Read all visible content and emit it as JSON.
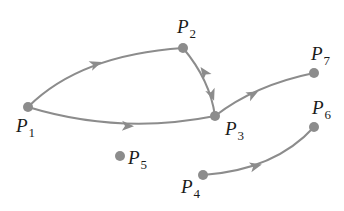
{
  "diagram": {
    "colors": {
      "edge": "#8c8c8c",
      "node": "#8c8c8c",
      "label": "#1a1a1a",
      "background": "#ffffff"
    },
    "nodes": [
      {
        "id": "P1",
        "letter": "P",
        "sub": "1",
        "x": 28,
        "y": 107,
        "lx": 16,
        "ly": 132
      },
      {
        "id": "P2",
        "letter": "P",
        "sub": "2",
        "x": 183,
        "y": 48,
        "lx": 177,
        "ly": 33
      },
      {
        "id": "P3",
        "letter": "P",
        "sub": "3",
        "x": 215,
        "y": 116,
        "lx": 225,
        "ly": 135
      },
      {
        "id": "P4",
        "letter": "P",
        "sub": "4",
        "x": 203,
        "y": 175,
        "lx": 181,
        "ly": 193
      },
      {
        "id": "P5",
        "letter": "P",
        "sub": "5",
        "x": 120,
        "y": 156,
        "lx": 128,
        "ly": 164
      },
      {
        "id": "P6",
        "letter": "P",
        "sub": "6",
        "x": 314,
        "y": 127,
        "lx": 312,
        "ly": 114
      },
      {
        "id": "P7",
        "letter": "P",
        "sub": "7",
        "x": 314,
        "y": 73,
        "lx": 311,
        "ly": 60
      }
    ],
    "edges": [
      {
        "from": "P1",
        "to": "P2",
        "path": "M28,107 Q80,55 183,48",
        "arrow": {
          "x": 96,
          "y": 64,
          "angle": -20
        }
      },
      {
        "from": "P1",
        "to": "P3",
        "path": "M28,107 Q120,135 215,116",
        "arrow": {
          "x": 128,
          "y": 126,
          "angle": 2
        }
      },
      {
        "from": "P2",
        "to": "P3",
        "path": "M183,48 Q210,80 215,116",
        "arrow": {
          "x": 204,
          "y": 72,
          "angle": -125
        },
        "arrow2": {
          "x": 212,
          "y": 95,
          "angle": 70
        }
      },
      {
        "from": "P3",
        "to": "P7",
        "path": "M215,116 Q255,85 314,73",
        "arrow": {
          "x": 253,
          "y": 94,
          "angle": -28
        }
      },
      {
        "from": "P4",
        "to": "P6",
        "path": "M203,175 Q275,170 314,127",
        "arrow": {
          "x": 256,
          "y": 166,
          "angle": -14
        }
      }
    ]
  }
}
